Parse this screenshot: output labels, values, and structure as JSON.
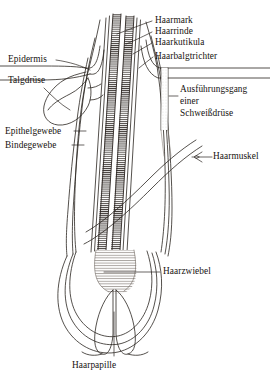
{
  "figure": {
    "language": "de",
    "background_color": "#ffffff",
    "ink_color": "#16120f",
    "line_color": "#2a2420"
  },
  "labels": {
    "haarmark": "Haarmark",
    "haarrinde": "Haarrinde",
    "haarkutikula": "Haarkutikula",
    "haarbalgtrichter": "Haarbalgtrichter",
    "epidermis": "Epidermis",
    "talgdruese": "Talgdrüse",
    "epithelgewebe": "Epithelgewebe",
    "bindegewebe": "Bindegewebe",
    "ausfuehrungsgang_line1": "Ausführungsgang",
    "ausfuehrungsgang_line2": "einer",
    "ausfuehrungsgang_line3": "Schweißdrüse",
    "haarmuskel": "Haarmuskel",
    "haarzwiebel": "Haarzwiebel",
    "haarpapille": "Haarpapille"
  },
  "parts": [
    {
      "id": "haarmark",
      "name": "Haarmark",
      "side": "right",
      "translation": "hair medulla"
    },
    {
      "id": "haarrinde",
      "name": "Haarrinde",
      "side": "right",
      "translation": "hair cortex"
    },
    {
      "id": "haarkutikula",
      "name": "Haarkutikula",
      "side": "right",
      "translation": "hair cuticle"
    },
    {
      "id": "haarbalgtrichter",
      "name": "Haarbalgtrichter",
      "side": "right",
      "translation": "follicular infundibulum"
    },
    {
      "id": "epidermis",
      "name": "Epidermis",
      "side": "left",
      "translation": "epidermis"
    },
    {
      "id": "talgdruese",
      "name": "Talgdrüse",
      "side": "left",
      "translation": "sebaceous gland"
    },
    {
      "id": "epithelgewebe",
      "name": "Epithelgewebe",
      "side": "left",
      "translation": "epithelial tissue"
    },
    {
      "id": "bindegewebe",
      "name": "Bindegewebe",
      "side": "left",
      "translation": "connective tissue"
    },
    {
      "id": "ausfuehrungsgang",
      "name": "Ausführungsgang einer Schweißdrüse",
      "side": "right",
      "translation": "sweat gland duct"
    },
    {
      "id": "haarmuskel",
      "name": "Haarmuskel",
      "side": "right",
      "translation": "arrector pili muscle"
    },
    {
      "id": "haarzwiebel",
      "name": "Haarzwiebel",
      "side": "right",
      "translation": "hair bulb"
    },
    {
      "id": "haarpapille",
      "name": "Haarpapille",
      "side": "bottom",
      "translation": "hair papilla"
    }
  ]
}
